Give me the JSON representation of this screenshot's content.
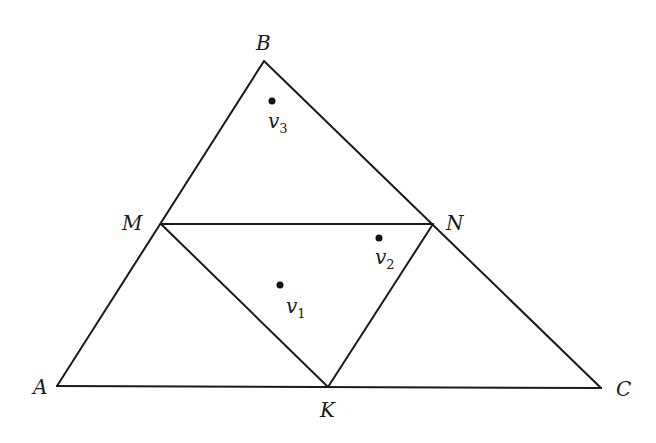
{
  "diagram": {
    "type": "triangle-subdivision",
    "colors": {
      "line": "#1a1a1a",
      "dot": "#111111",
      "background": "#ffffff"
    },
    "vertices": {
      "A": {
        "label": "A",
        "x": 57,
        "y": 386
      },
      "B": {
        "label": "B",
        "x": 264,
        "y": 61
      },
      "C": {
        "label": "C",
        "x": 601,
        "y": 388
      },
      "M": {
        "label": "M",
        "x": 161,
        "y": 224
      },
      "N": {
        "label": "N",
        "x": 433,
        "y": 224
      },
      "K": {
        "label": "K",
        "x": 328,
        "y": 387
      }
    },
    "edges": [
      [
        "A",
        "B"
      ],
      [
        "B",
        "C"
      ],
      [
        "A",
        "C"
      ],
      [
        "M",
        "N"
      ],
      [
        "M",
        "K"
      ],
      [
        "N",
        "K"
      ]
    ],
    "points": [
      {
        "id": "v1",
        "base": "v",
        "sub": "1",
        "x": 280,
        "y": 285
      },
      {
        "id": "v2",
        "base": "v",
        "sub": "2",
        "x": 379,
        "y": 238
      },
      {
        "id": "v3",
        "base": "v",
        "sub": "3",
        "x": 272,
        "y": 101
      }
    ]
  }
}
